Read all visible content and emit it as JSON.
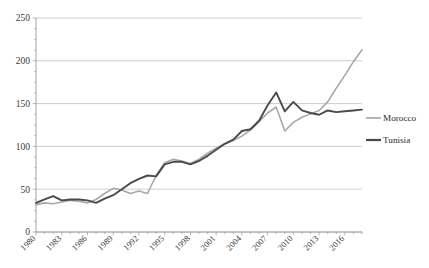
{
  "chart_data": {
    "type": "line",
    "title": "",
    "subtitle": "",
    "xlabel": "",
    "ylabel": "",
    "xlim": [
      1980,
      2018
    ],
    "ylim": [
      0,
      250
    ],
    "yticks": [
      0,
      50,
      100,
      150,
      200,
      250
    ],
    "xticks": [
      1980,
      1983,
      1986,
      1989,
      1992,
      1995,
      1998,
      2001,
      2004,
      2007,
      2010,
      2013,
      2016
    ],
    "xtick_labels": [
      "1980",
      "1983",
      "1986",
      "1989",
      "1992",
      "1995",
      "1998",
      "2001",
      "2004",
      "2007",
      "2010",
      "2013",
      "2016"
    ],
    "ytick_labels": [
      "0",
      "50",
      "100",
      "150",
      "200",
      "250"
    ],
    "grid": true,
    "grid_axis": "y",
    "legend_position": "right",
    "x": [
      1980,
      1981,
      1982,
      1983,
      1984,
      1985,
      1986,
      1987,
      1988,
      1989,
      1990,
      1991,
      1992,
      1993,
      1994,
      1995,
      1996,
      1997,
      1998,
      1999,
      2000,
      2001,
      2002,
      2003,
      2004,
      2005,
      2006,
      2007,
      2008,
      2009,
      2010,
      2011,
      2012,
      2013,
      2014,
      2015,
      2016,
      2017,
      2018
    ],
    "series": [
      {
        "name": "Morocco",
        "color": "#a8a8a8",
        "values": [
          32,
          34,
          33,
          35,
          37,
          36,
          34,
          38,
          45,
          51,
          49,
          45,
          48,
          45,
          66,
          81,
          85,
          83,
          80,
          85,
          92,
          98,
          103,
          107,
          112,
          119,
          129,
          139,
          146,
          118,
          128,
          134,
          138,
          142,
          152,
          168,
          183,
          199,
          213
        ]
      },
      {
        "name": "Tunisia",
        "color": "#4a4a4a",
        "values": [
          34,
          38,
          42,
          37,
          38,
          38,
          37,
          34,
          39,
          43,
          50,
          57,
          62,
          66,
          65,
          79,
          82,
          82,
          79,
          83,
          89,
          96,
          103,
          108,
          118,
          120,
          130,
          148,
          163,
          141,
          152,
          142,
          139,
          137,
          142,
          140,
          141,
          142,
          143
        ]
      }
    ]
  },
  "legend": {
    "items": [
      {
        "label": "Morocco",
        "color": "#a8a8a8"
      },
      {
        "label": "Tunisia",
        "color": "#4a4a4a"
      }
    ]
  }
}
